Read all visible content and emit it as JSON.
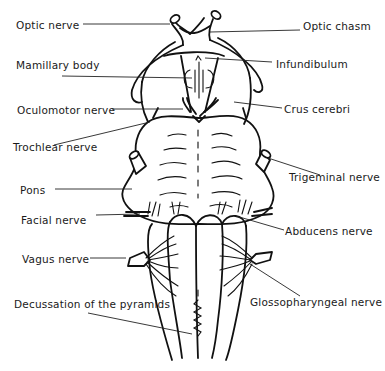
{
  "figure": {
    "labels": {
      "optic_nerve": "Optic nerve",
      "optic_chiasm": "Optic chasm",
      "mamillary_body": "Mamillary body",
      "infundibulum": "Infundibulum",
      "oculomotor_nerve": "Oculomotor nerve",
      "crus_cerebri": "Crus cerebri",
      "trochlear_nerve": "Trochlear nerve",
      "trigeminal_nerve": "Trigeminal nerve",
      "pons": "Pons",
      "facial_nerve": "Facial nerve",
      "abducens_nerve": "Abducens nerve",
      "vagus_nerve": "Vagus nerve",
      "glossopharyngeal_nerve": "Glossopharyngeal nerve",
      "decussation_pyramids": "Decussation of the pyramids"
    },
    "colors": {
      "line": "#111111",
      "text": "#1a1a1a",
      "background": "#ffffff"
    }
  }
}
